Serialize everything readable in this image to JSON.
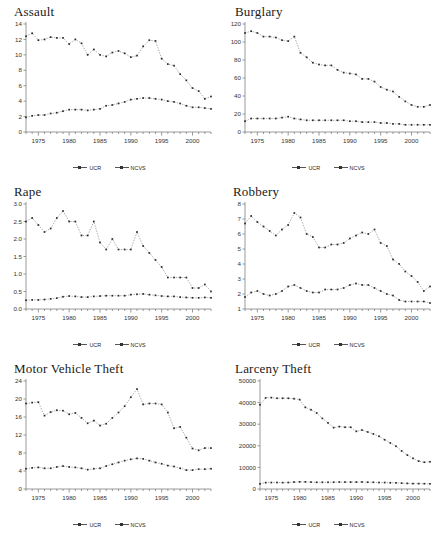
{
  "figure": {
    "panel_count": 6,
    "series_names": [
      "UCR",
      "NCVS"
    ],
    "legend_labels": {
      "ucr": "UCR",
      "ncvs": "NCVS"
    },
    "x_tick_labels": [
      "1975",
      "1980",
      "1985",
      "1990",
      "1995",
      "2000"
    ],
    "x_range": [
      1973,
      2003
    ],
    "colors": {
      "ucr": "#555555",
      "ncvs": "#333333",
      "axis": "#808080",
      "text": "#222222"
    }
  },
  "chart_data": [
    {
      "type": "line",
      "title": "Assault",
      "xlabel": "",
      "ylabel": "",
      "xlim": [
        1973,
        2003
      ],
      "ylim": [
        0,
        14
      ],
      "yticks": [
        0,
        2,
        4,
        6,
        8,
        10,
        12,
        14
      ],
      "ytick_labels": [
        "0",
        "2",
        "4",
        "6",
        "8",
        "10",
        "12",
        "14"
      ],
      "xticks": [
        1975,
        1980,
        1985,
        1990,
        1995,
        2000
      ],
      "grid": false,
      "legend_position": "bottom",
      "x": [
        1973,
        1974,
        1975,
        1976,
        1977,
        1978,
        1979,
        1980,
        1981,
        1982,
        1983,
        1984,
        1985,
        1986,
        1987,
        1988,
        1989,
        1990,
        1991,
        1992,
        1993,
        1994,
        1995,
        1996,
        1997,
        1998,
        1999,
        2000,
        2001,
        2002,
        2003
      ],
      "series": [
        {
          "name": "NCVS",
          "values": [
            12.4,
            12.8,
            11.9,
            12.0,
            12.3,
            12.2,
            12.2,
            11.4,
            12.0,
            11.5,
            10.0,
            10.7,
            10.0,
            9.8,
            10.3,
            10.5,
            10.2,
            9.7,
            9.9,
            11.1,
            11.9,
            11.8,
            9.5,
            8.8,
            8.6,
            7.5,
            6.7,
            5.7,
            5.3,
            4.3,
            4.6
          ]
        },
        {
          "name": "UCR",
          "values": [
            1.9,
            2.1,
            2.2,
            2.2,
            2.4,
            2.5,
            2.7,
            2.9,
            2.9,
            2.9,
            2.8,
            2.9,
            3.0,
            3.4,
            3.5,
            3.7,
            3.9,
            4.2,
            4.3,
            4.4,
            4.4,
            4.3,
            4.2,
            4.0,
            3.9,
            3.7,
            3.4,
            3.2,
            3.2,
            3.1,
            3.0
          ]
        }
      ]
    },
    {
      "type": "line",
      "title": "Burglary",
      "xlabel": "",
      "ylabel": "",
      "xlim": [
        1973,
        2003
      ],
      "ylim": [
        0,
        120
      ],
      "yticks": [
        0,
        20,
        40,
        60,
        80,
        100,
        120
      ],
      "ytick_labels": [
        "0",
        "20",
        "40",
        "60",
        "80",
        "100",
        "120"
      ],
      "xticks": [
        1975,
        1980,
        1985,
        1990,
        1995,
        2000
      ],
      "grid": false,
      "legend_position": "bottom",
      "x": [
        1973,
        1974,
        1975,
        1976,
        1977,
        1978,
        1979,
        1980,
        1981,
        1982,
        1983,
        1984,
        1985,
        1986,
        1987,
        1988,
        1989,
        1990,
        1991,
        1992,
        1993,
        1994,
        1995,
        1996,
        1997,
        1998,
        1999,
        2000,
        2001,
        2002,
        2003
      ],
      "series": [
        {
          "name": "NCVS",
          "values": [
            110,
            112,
            110,
            106,
            106,
            105,
            102,
            101,
            106,
            88,
            83,
            77,
            75,
            74,
            74,
            69,
            66,
            65,
            64,
            59,
            59,
            56,
            50,
            47,
            45,
            39,
            34,
            30,
            28,
            28,
            30
          ]
        },
        {
          "name": "UCR",
          "values": [
            12,
            15,
            15,
            15,
            15,
            15,
            16,
            17,
            15,
            14,
            13,
            13,
            13,
            13,
            13,
            13,
            13,
            12,
            12,
            11,
            11,
            11,
            10,
            10,
            9,
            9,
            8,
            8,
            8,
            8,
            8
          ]
        }
      ]
    },
    {
      "type": "line",
      "title": "Rape",
      "xlabel": "",
      "ylabel": "",
      "xlim": [
        1973,
        2003
      ],
      "ylim": [
        0.0,
        3.0
      ],
      "yticks": [
        0.0,
        0.5,
        1.0,
        1.5,
        2.0,
        2.5,
        3.0
      ],
      "ytick_labels": [
        "0.0",
        "0.5",
        "1.0",
        "1.5",
        "2.0",
        "2.5",
        "3.0"
      ],
      "xticks": [
        1975,
        1980,
        1985,
        1990,
        1995,
        2000
      ],
      "grid": false,
      "legend_position": "bottom",
      "x": [
        1973,
        1974,
        1975,
        1976,
        1977,
        1978,
        1979,
        1980,
        1981,
        1982,
        1983,
        1984,
        1985,
        1986,
        1987,
        1988,
        1989,
        1990,
        1991,
        1992,
        1993,
        1994,
        1995,
        1996,
        1997,
        1998,
        1999,
        2000,
        2001,
        2002,
        2003
      ],
      "series": [
        {
          "name": "NCVS",
          "values": [
            2.5,
            2.6,
            2.4,
            2.2,
            2.3,
            2.6,
            2.8,
            2.5,
            2.5,
            2.1,
            2.1,
            2.5,
            1.9,
            1.7,
            2.0,
            1.7,
            1.7,
            1.7,
            2.2,
            1.8,
            1.6,
            1.4,
            1.2,
            0.9,
            0.9,
            0.9,
            0.9,
            0.6,
            0.6,
            0.7,
            0.5
          ]
        },
        {
          "name": "UCR",
          "values": [
            0.25,
            0.26,
            0.26,
            0.27,
            0.29,
            0.31,
            0.35,
            0.37,
            0.36,
            0.34,
            0.34,
            0.36,
            0.37,
            0.38,
            0.38,
            0.38,
            0.38,
            0.41,
            0.42,
            0.43,
            0.41,
            0.39,
            0.37,
            0.36,
            0.36,
            0.34,
            0.33,
            0.32,
            0.32,
            0.33,
            0.32
          ]
        }
      ]
    },
    {
      "type": "line",
      "title": "Robbery",
      "xlabel": "",
      "ylabel": "",
      "xlim": [
        1973,
        2003
      ],
      "ylim": [
        1,
        8
      ],
      "yticks": [
        1,
        2,
        3,
        4,
        5,
        6,
        7,
        8
      ],
      "ytick_labels": [
        "1",
        "2",
        "3",
        "4",
        "5",
        "6",
        "7",
        "8"
      ],
      "xticks": [
        1975,
        1980,
        1985,
        1990,
        1995,
        2000
      ],
      "grid": false,
      "legend_position": "bottom",
      "x": [
        1973,
        1974,
        1975,
        1976,
        1977,
        1978,
        1979,
        1980,
        1981,
        1982,
        1983,
        1984,
        1985,
        1986,
        1987,
        1988,
        1989,
        1990,
        1991,
        1992,
        1993,
        1994,
        1995,
        1996,
        1997,
        1998,
        1999,
        2000,
        2001,
        2002,
        2003
      ],
      "series": [
        {
          "name": "NCVS",
          "values": [
            6.7,
            7.2,
            6.8,
            6.5,
            6.2,
            5.9,
            6.3,
            6.6,
            7.4,
            7.1,
            6.0,
            5.8,
            5.1,
            5.1,
            5.3,
            5.3,
            5.4,
            5.7,
            5.9,
            6.1,
            6.0,
            6.3,
            5.4,
            5.2,
            4.3,
            4.0,
            3.5,
            3.2,
            2.8,
            2.2,
            2.5
          ]
        },
        {
          "name": "UCR",
          "values": [
            1.8,
            2.1,
            2.2,
            2.0,
            1.9,
            2.0,
            2.2,
            2.5,
            2.6,
            2.4,
            2.2,
            2.1,
            2.1,
            2.3,
            2.3,
            2.3,
            2.4,
            2.6,
            2.7,
            2.6,
            2.6,
            2.4,
            2.2,
            2.0,
            1.9,
            1.6,
            1.5,
            1.5,
            1.5,
            1.5,
            1.4
          ]
        }
      ]
    },
    {
      "type": "line",
      "title": "Motor Vehicle Theft",
      "xlabel": "",
      "ylabel": "",
      "xlim": [
        1973,
        2003
      ],
      "ylim": [
        0,
        24
      ],
      "yticks": [
        0,
        4,
        8,
        12,
        16,
        20,
        24
      ],
      "ytick_labels": [
        "0",
        "4",
        "8",
        "12",
        "16",
        "20",
        "24"
      ],
      "xticks": [
        1975,
        1980,
        1985,
        1990,
        1995,
        2000
      ],
      "grid": false,
      "legend_position": "bottom",
      "x": [
        1973,
        1974,
        1975,
        1976,
        1977,
        1978,
        1979,
        1980,
        1981,
        1982,
        1983,
        1984,
        1985,
        1986,
        1987,
        1988,
        1989,
        1990,
        1991,
        1992,
        1993,
        1994,
        1995,
        1996,
        1997,
        1998,
        1999,
        2000,
        2001,
        2002,
        2003
      ],
      "series": [
        {
          "name": "NCVS",
          "values": [
            19.0,
            19.2,
            19.3,
            16.3,
            17.1,
            17.5,
            17.4,
            16.6,
            16.9,
            15.8,
            14.6,
            15.2,
            14.1,
            14.5,
            15.8,
            17.0,
            18.4,
            20.4,
            22.2,
            18.8,
            19.0,
            19.0,
            18.8,
            17.0,
            13.5,
            13.8,
            11.4,
            9.0,
            8.6,
            9.1,
            9.1
          ]
        },
        {
          "name": "UCR",
          "values": [
            4.5,
            4.7,
            4.8,
            4.6,
            4.6,
            4.9,
            5.1,
            4.9,
            4.8,
            4.6,
            4.3,
            4.5,
            4.6,
            5.1,
            5.5,
            5.9,
            6.3,
            6.6,
            6.8,
            6.7,
            6.3,
            5.9,
            5.6,
            5.2,
            5.0,
            4.6,
            4.2,
            4.2,
            4.4,
            4.4,
            4.5
          ]
        }
      ]
    },
    {
      "type": "line",
      "title": "Larceny Theft",
      "xlabel": "",
      "ylabel": "",
      "xlim": [
        1973,
        2003
      ],
      "ylim": [
        0,
        50000
      ],
      "yticks": [
        0,
        10000,
        20000,
        30000,
        40000,
        50000
      ],
      "ytick_labels": [
        "0",
        "10000",
        "20000",
        "30000",
        "40000",
        "50000"
      ],
      "xticks": [
        1975,
        1980,
        1985,
        1990,
        1995,
        2000
      ],
      "grid": false,
      "legend_position": "bottom",
      "x": [
        1973,
        1974,
        1975,
        1976,
        1977,
        1978,
        1979,
        1980,
        1981,
        1982,
        1983,
        1984,
        1985,
        1986,
        1987,
        1988,
        1989,
        1990,
        1991,
        1992,
        1993,
        1994,
        1995,
        1996,
        1997,
        1998,
        1999,
        2000,
        2001,
        2002,
        2003
      ],
      "series": [
        {
          "name": "NCVS",
          "values": [
            39000,
            42200,
            42300,
            42000,
            42000,
            42000,
            41800,
            41400,
            37800,
            36700,
            35200,
            32700,
            30600,
            28400,
            28900,
            28600,
            28600,
            26700,
            27300,
            26400,
            25500,
            24400,
            22800,
            21300,
            19800,
            17600,
            15700,
            14200,
            12900,
            12400,
            12600
          ]
        },
        {
          "name": "UCR",
          "values": [
            2400,
            2950,
            3000,
            3000,
            2950,
            3000,
            3200,
            3300,
            3300,
            3200,
            3100,
            3100,
            3100,
            3150,
            3200,
            3200,
            3200,
            3200,
            3250,
            3150,
            3100,
            3000,
            3000,
            2900,
            2850,
            2700,
            2600,
            2500,
            2500,
            2450,
            2400
          ]
        }
      ]
    }
  ]
}
